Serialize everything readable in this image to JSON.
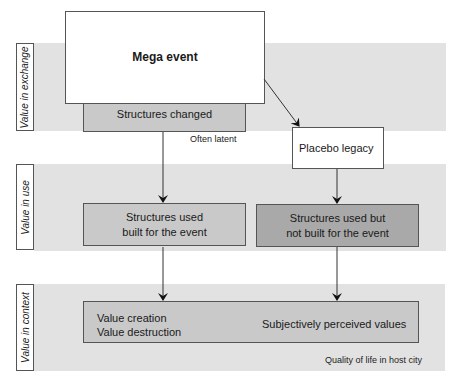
{
  "bands": [
    {
      "label": "Value in exchange"
    },
    {
      "label": "Value in use"
    },
    {
      "label": "Value in context"
    }
  ],
  "nodes": {
    "mega_event": "Mega event",
    "structures_changed": "Structures changed",
    "placebo_legacy": "Placebo legacy",
    "structures_used_built_line1": "Structures used",
    "structures_used_built_line2": "built for the event",
    "structures_used_not_built_line1": "Structures used but",
    "structures_used_not_built_line2": "not built for the event",
    "value_creation": "Value creation",
    "value_destruction": "Value destruction",
    "subjective_values": "Subjectively perceived values"
  },
  "notes": {
    "often_latent": "Often latent",
    "quality_of_life": "Quality of life in host city"
  },
  "colors": {
    "band": "#e2e2e2",
    "box_mid": "#c9c9c9",
    "box_dark": "#a9a9a9",
    "border": "#555555"
  }
}
